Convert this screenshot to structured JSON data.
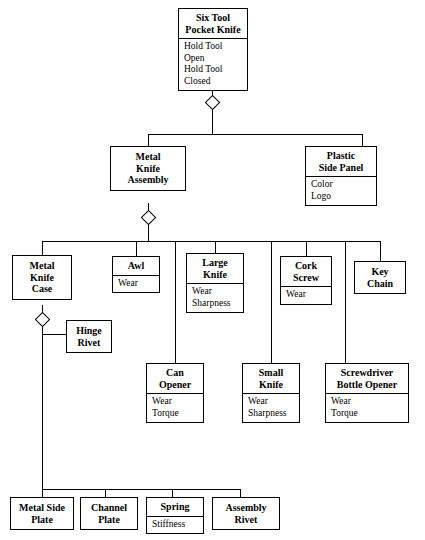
{
  "diagram": {
    "nodes": [
      {
        "id": "root",
        "title": "Six Tool\nPocket Knife",
        "attrs": [
          "Hold Tool Open",
          "Hold Tool Closed"
        ]
      },
      {
        "id": "metalasm",
        "title": "Metal\nKnife\nAssembly",
        "attrs": []
      },
      {
        "id": "sidepanel",
        "title": "Plastic\nSide Panel",
        "attrs": [
          "Color",
          "Logo"
        ]
      },
      {
        "id": "knifecase",
        "title": "Metal\nKnife\nCase",
        "attrs": []
      },
      {
        "id": "awl",
        "title": "Awl",
        "attrs": [
          "Wear"
        ]
      },
      {
        "id": "largeknife",
        "title": "Large\nKnife",
        "attrs": [
          "Wear",
          "Sharpness"
        ]
      },
      {
        "id": "corkscrew",
        "title": "Cork\nScrew",
        "attrs": [
          "Wear"
        ]
      },
      {
        "id": "keychain",
        "title": "Key\nChain",
        "attrs": []
      },
      {
        "id": "hingerivet",
        "title": "Hinge\nRivet",
        "attrs": []
      },
      {
        "id": "canopener",
        "title": "Can\nOpener",
        "attrs": [
          "Wear",
          "Torque"
        ]
      },
      {
        "id": "smallknife",
        "title": "Small\nKnife",
        "attrs": [
          "Wear",
          "Sharpness"
        ]
      },
      {
        "id": "screwdriver",
        "title": "Screwdriver\nBottle Opener",
        "attrs": [
          "Wear",
          "Torque"
        ]
      },
      {
        "id": "sideplate",
        "title": "Metal Side\nPlate",
        "attrs": []
      },
      {
        "id": "channelplate",
        "title": "Channel\nPlate",
        "attrs": []
      },
      {
        "id": "spring",
        "title": "Spring",
        "attrs": [
          "Stiffness"
        ]
      },
      {
        "id": "asmrivet",
        "title": "Assembly\nRivet",
        "attrs": []
      }
    ],
    "colors": {
      "line": "#000000",
      "background": "#ffffff",
      "text": "#000000"
    }
  }
}
